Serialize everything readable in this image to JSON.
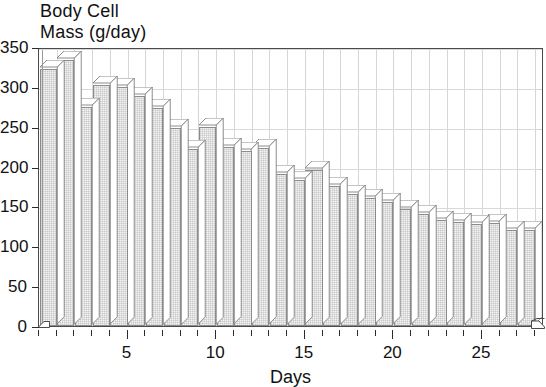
{
  "chart_data": {
    "type": "bar",
    "title": "Body Cell Mass (g/day)",
    "title_line_1": "Body Cell",
    "title_line_2": "Mass (g/day)",
    "xlabel": "Days",
    "ylabel": "",
    "xlim": [
      0,
      28.5
    ],
    "ylim": [
      0,
      350
    ],
    "ytick_values": [
      0,
      50,
      100,
      150,
      200,
      250,
      300,
      350
    ],
    "ytick_labels": [
      "0",
      "50",
      "100",
      "150",
      "200",
      "250",
      "300",
      "350"
    ],
    "xtick_major_values": [
      5,
      10,
      15,
      20,
      25
    ],
    "xtick_major_labels": [
      "5",
      "10",
      "15",
      "20",
      "25"
    ],
    "xtick_minor_step": 1,
    "grid": true,
    "legend": null,
    "bar_style": "3d-shaded",
    "bar_fill_color": "#f4f4f4",
    "bar_edge_color": "#8c8c8c",
    "axis_color": "#2b2b2b",
    "grid_color": "#d6d6d6",
    "categories": [
      1,
      2,
      3,
      4,
      5,
      6,
      7,
      8,
      9,
      10,
      11,
      12,
      13,
      14,
      15,
      16,
      17,
      18,
      19,
      20,
      21,
      22,
      23,
      24,
      25,
      26,
      27,
      28
    ],
    "values": [
      322,
      334,
      275,
      302,
      300,
      289,
      274,
      249,
      222,
      250,
      224,
      220,
      223,
      191,
      183,
      196,
      176,
      166,
      160,
      155,
      147,
      140,
      133,
      131,
      128,
      129,
      121,
      120
    ]
  },
  "axis": {
    "x_title": "Days"
  }
}
